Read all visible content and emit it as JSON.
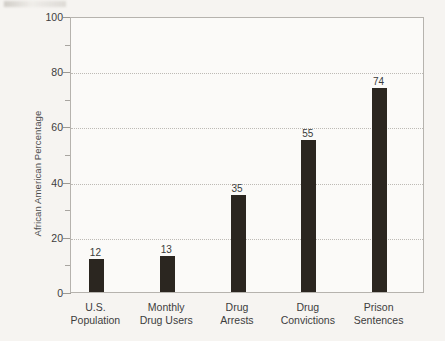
{
  "chart_data": {
    "type": "bar",
    "title": "",
    "subtitle": "",
    "xlabel": "",
    "ylabel": "African American Percentage",
    "categories": [
      "U.S.\nPopulation",
      "Monthly\nDrug Users",
      "Drug\nArrests",
      "Drug\nConvictions",
      "Prison\nSentences"
    ],
    "values": [
      12,
      13,
      35,
      55,
      74
    ],
    "value_labels": [
      "12",
      "13",
      "35",
      "55",
      "74"
    ],
    "ylim": [
      0,
      100
    ],
    "yticks": [
      0,
      20,
      40,
      60,
      80,
      100
    ],
    "ytick_labels": [
      "0",
      "20",
      "40",
      "60",
      "80",
      "100"
    ],
    "yminor_ticks": [
      10,
      30,
      50,
      70,
      90
    ],
    "grid": "horizontal-dotted",
    "legend": "none",
    "bar_color": "#2b2620",
    "grid_color": "#bdbab5",
    "axis_color": "#b6b3ae",
    "background_color": "#f6f4f1",
    "plot_background_color": "#fbfaf8",
    "text_color": "#3d3d3d"
  }
}
